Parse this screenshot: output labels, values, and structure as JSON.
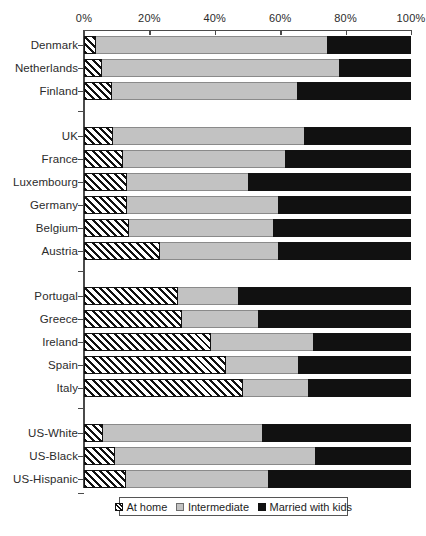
{
  "chart_data": {
    "type": "bar",
    "orientation": "horizontal",
    "stacked": true,
    "normalized": true,
    "title": "",
    "subtitle": "",
    "xlabel": "",
    "ylabel": "",
    "xlim": [
      0,
      100
    ],
    "xticks": [
      0,
      20,
      40,
      60,
      80,
      100
    ],
    "xticklabels": [
      "0%",
      "20%",
      "40%",
      "60%",
      "80%",
      "100%"
    ],
    "grid": false,
    "legend_position": "bottom",
    "series": [
      {
        "name": "At home",
        "pattern": "diagonal-hatch",
        "color": "#ffffff",
        "values": [
          3.7,
          5.5,
          8.6,
          8.9,
          11.9,
          13.1,
          13.1,
          13.8,
          23.2,
          28.8,
          30.0,
          38.8,
          43.4,
          48.6,
          5.8,
          9.5,
          12.8
        ]
      },
      {
        "name": "Intermediate",
        "pattern": "solid",
        "color": "#c2c2c2",
        "values": [
          70.6,
          72.5,
          56.5,
          58.4,
          49.6,
          37.0,
          46.2,
          44.0,
          36.1,
          18.3,
          23.2,
          31.2,
          22.0,
          19.9,
          48.5,
          61.1,
          43.4
        ]
      },
      {
        "name": "Married with kids",
        "pattern": "solid",
        "color": "#111111",
        "values": [
          25.7,
          22.0,
          34.9,
          32.7,
          38.5,
          49.9,
          40.7,
          42.2,
          40.7,
          52.9,
          46.8,
          30.0,
          34.6,
          31.5,
          45.7,
          29.4,
          43.8
        ]
      }
    ],
    "groups": [
      {
        "name": "nordic",
        "categories": [
          "Denmark",
          "Netherlands",
          "Finland"
        ]
      },
      {
        "name": "central",
        "categories": [
          "UK",
          "France",
          "Luxembourg",
          "Germany",
          "Belgium",
          "Austria"
        ]
      },
      {
        "name": "southern",
        "categories": [
          "Portugal",
          "Greece",
          "Ireland",
          "Spain",
          "Italy"
        ]
      },
      {
        "name": "us",
        "categories": [
          "US-White",
          "US-Black",
          "US-Hispanic"
        ]
      }
    ],
    "categories": [
      "Denmark",
      "Netherlands",
      "Finland",
      "UK",
      "France",
      "Luxembourg",
      "Germany",
      "Belgium",
      "Austria",
      "Portugal",
      "Greece",
      "Ireland",
      "Spain",
      "Italy",
      "US-White",
      "US-Black",
      "US-Hispanic"
    ]
  },
  "legend": {
    "items": [
      {
        "label": "At home",
        "key": "key-home"
      },
      {
        "label": "Intermediate",
        "key": "key-inter"
      },
      {
        "label": "Married with kids",
        "key": "key-married"
      }
    ]
  }
}
